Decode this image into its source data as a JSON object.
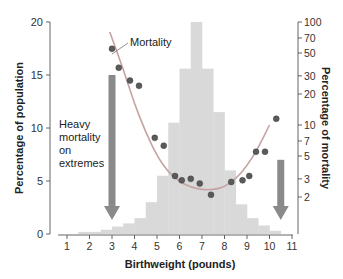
{
  "chart_data": {
    "type": "bar",
    "title": "",
    "xlabel": "Birthweight (pounds)",
    "ylabel": "Percentage of population",
    "y2label": "Percentage of mortality",
    "xlim": [
      0.5,
      11
    ],
    "ylim": [
      0,
      20
    ],
    "y2_scale": "log",
    "y2lim": [
      1,
      100
    ],
    "x_ticks": [
      "1",
      "2",
      "3",
      "4",
      "5",
      "6",
      "7",
      "8",
      "9",
      "10",
      "11"
    ],
    "y_ticks": [
      "0",
      "5",
      "10",
      "15",
      "20"
    ],
    "y2_ticks": [
      "2",
      "3",
      "5",
      "7",
      "10",
      "20",
      "30",
      "50",
      "70",
      "100"
    ],
    "grid": false,
    "legend": null,
    "series": [
      {
        "name": "Population (histogram)",
        "type": "bar",
        "color": "#d9d9d9",
        "bins": [
          {
            "x0": 1.5,
            "x1": 2.5,
            "value": 0.2
          },
          {
            "x0": 2.5,
            "x1": 3.0,
            "value": 0.4
          },
          {
            "x0": 3.0,
            "x1": 3.5,
            "value": 0.7
          },
          {
            "x0": 3.5,
            "x1": 4.0,
            "value": 1.0
          },
          {
            "x0": 4.0,
            "x1": 4.5,
            "value": 1.5
          },
          {
            "x0": 4.5,
            "x1": 5.0,
            "value": 3.0
          },
          {
            "x0": 5.0,
            "x1": 5.5,
            "value": 5.5
          },
          {
            "x0": 5.5,
            "x1": 6.0,
            "value": 10.5
          },
          {
            "x0": 6.0,
            "x1": 6.5,
            "value": 15.6
          },
          {
            "x0": 6.5,
            "x1": 7.0,
            "value": 20.0
          },
          {
            "x0": 7.0,
            "x1": 7.5,
            "value": 15.6
          },
          {
            "x0": 7.5,
            "x1": 8.0,
            "value": 11.5
          },
          {
            "x0": 8.0,
            "x1": 8.5,
            "value": 6.0
          },
          {
            "x0": 8.5,
            "x1": 9.0,
            "value": 2.8
          },
          {
            "x0": 9.0,
            "x1": 9.5,
            "value": 1.5
          },
          {
            "x0": 9.5,
            "x1": 10.0,
            "value": 0.8
          },
          {
            "x0": 10.0,
            "x1": 10.5,
            "value": 0.3
          }
        ]
      },
      {
        "name": "Mortality",
        "type": "scatter",
        "axis": "y2",
        "color": "#555555",
        "points": [
          {
            "x": 3.0,
            "y": 55
          },
          {
            "x": 3.3,
            "y": 36
          },
          {
            "x": 3.8,
            "y": 27
          },
          {
            "x": 4.2,
            "y": 24
          },
          {
            "x": 4.9,
            "y": 7.5
          },
          {
            "x": 5.3,
            "y": 6.3
          },
          {
            "x": 5.8,
            "y": 3.2
          },
          {
            "x": 6.1,
            "y": 2.9
          },
          {
            "x": 6.5,
            "y": 3.0
          },
          {
            "x": 6.9,
            "y": 2.7
          },
          {
            "x": 7.4,
            "y": 2.1
          },
          {
            "x": 8.3,
            "y": 2.8
          },
          {
            "x": 8.8,
            "y": 2.9
          },
          {
            "x": 9.1,
            "y": 3.2
          },
          {
            "x": 9.4,
            "y": 5.5
          },
          {
            "x": 9.8,
            "y": 5.5
          },
          {
            "x": 10.3,
            "y": 11.5
          }
        ]
      },
      {
        "name": "Mortality curve",
        "type": "line",
        "axis": "y2",
        "color": "#c9a0a0",
        "points": [
          {
            "x": 2.9,
            "y": 80
          },
          {
            "x": 3.5,
            "y": 35
          },
          {
            "x": 4.0,
            "y": 16
          },
          {
            "x": 4.5,
            "y": 8.5
          },
          {
            "x": 5.0,
            "y": 5.0
          },
          {
            "x": 5.5,
            "y": 3.5
          },
          {
            "x": 6.0,
            "y": 2.8
          },
          {
            "x": 6.5,
            "y": 2.5
          },
          {
            "x": 7.0,
            "y": 2.35
          },
          {
            "x": 7.5,
            "y": 2.35
          },
          {
            "x": 8.0,
            "y": 2.5
          },
          {
            "x": 8.5,
            "y": 3.0
          },
          {
            "x": 9.0,
            "y": 4.0
          },
          {
            "x": 9.5,
            "y": 6.0
          },
          {
            "x": 10.0,
            "y": 10.0
          }
        ]
      }
    ],
    "annotations": [
      {
        "text": "Mortality",
        "x": 4.2,
        "y2": 58
      },
      {
        "text": "Heavy mortality on extremes",
        "lines": [
          "Heavy",
          "mortality",
          "on",
          "extremes"
        ],
        "x": 1.1,
        "y": 9
      },
      {
        "type": "arrow",
        "direction": "down",
        "x": 3.0,
        "from_y": 15,
        "to_y": 1.5,
        "color": "#808080"
      },
      {
        "type": "arrow",
        "direction": "down",
        "x": 10.5,
        "from_y": 7,
        "to_y": 1.5,
        "color": "#808080"
      }
    ]
  },
  "labels": {
    "xlabel": "Birthweight (pounds)",
    "ylabel": "Percentage of population",
    "y2label": "Percentage of mortality",
    "mortality_callout": "Mortality",
    "heavy_1": "Heavy",
    "heavy_2": "mortality",
    "heavy_3": "on",
    "heavy_4": "extremes"
  },
  "colors": {
    "bar": "#d9d9d9",
    "arrow": "#8a8a8a",
    "curve": "#c6a3a3",
    "point": "#5a5a5a",
    "axis": "#555555",
    "text": "#222222"
  }
}
